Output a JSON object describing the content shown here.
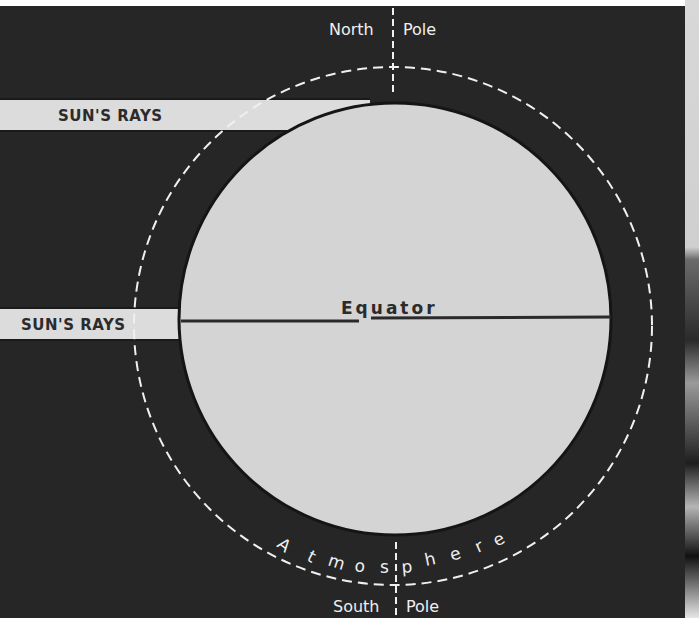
{
  "diagram": {
    "type": "sun-rays-earth-atmosphere",
    "labels": {
      "north_pole_left": "North",
      "north_pole_right": "Pole",
      "south_pole_left": "South",
      "south_pole_right": "Pole",
      "equator": "Equator",
      "atmosphere": "Atmosphere",
      "sun_rays_upper": "SUN'S RAYS",
      "sun_rays_lower": "SUN'S RAYS"
    },
    "colors": {
      "background": "#262626",
      "globe": "#d4d4d4",
      "ray_band": "#dcdcdc",
      "dashed_line": "#f0f0f0",
      "equator_line": "#2a2a2a",
      "dark_text": "#2b2b2b",
      "light_text": "#efefef"
    },
    "atmosphere_letters": [
      "A",
      "t",
      "m",
      "o",
      "s",
      "p",
      "h",
      "e",
      "r",
      "e"
    ]
  }
}
